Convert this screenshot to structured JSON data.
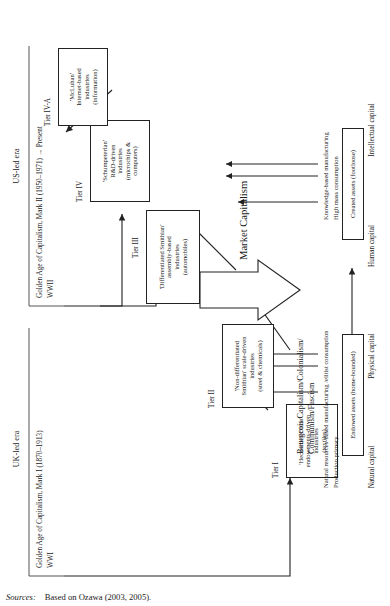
{
  "figure": {
    "orientation": "rotated-90-ccw",
    "sources_label": "Sources:",
    "sources_text": "Based on Ozawa (2003, 2005)."
  },
  "eras": [
    {
      "id": "uk",
      "name": "UK-led era",
      "golden_age": "Golden Age of Capitalism, Mark I (1870–1913)",
      "war": "WWI"
    },
    {
      "id": "us",
      "name": "US-led era",
      "golden_age": "Golden Age of Capitalism, Mark II (1950–1971) → Present",
      "war": "WWII"
    }
  ],
  "tiers": [
    {
      "id": "tier1",
      "label": "Tier I",
      "lines": [
        "'Heckscher-Ohlin'",
        "endowments-driven",
        "industries",
        "(textiles)"
      ]
    },
    {
      "id": "tier2",
      "label": "Tier II",
      "lines": [
        "'Non-differentiated",
        "Smithian' scale-driven",
        "industries",
        "(steel & chemicals)"
      ]
    },
    {
      "id": "tier3",
      "label": "Tier III",
      "lines": [
        "'Differentiated Smithian'",
        "assembly-based",
        "industries",
        "(automobiles)"
      ]
    },
    {
      "id": "tier4",
      "label": "Tier IV",
      "lines": [
        "'Schumpeterian'",
        "R&D-driven",
        "industries",
        "(microchips &",
        "computers)"
      ]
    },
    {
      "id": "tier4a",
      "label": "Tier IV-A",
      "lines": [
        "'McLuhan'",
        "Internet-based",
        "industries",
        "(information)"
      ]
    }
  ],
  "regimes": {
    "bourgeois_line1": "Bourgeois Capitalism/Colonialism/",
    "bourgeois_line2": "Communism/Fascism",
    "market": "Market Capitalism"
  },
  "modes": {
    "early_line1": "Natural resources-based manufacturing /elitist consumption",
    "early_line2": "Production primary",
    "late_line1": "Knowledge-based manufacturing",
    "late_line2": "High mass consumption"
  },
  "assets": [
    {
      "id": "endowed",
      "label": "Endowed assets (home-bounded)"
    },
    {
      "id": "created",
      "label": "Created assets (footloose)"
    }
  ],
  "capitals": [
    {
      "id": "natural",
      "label": "Natural capital"
    },
    {
      "id": "physical",
      "label": "Physical capital"
    },
    {
      "id": "human",
      "label": "Human capital"
    },
    {
      "id": "intellectual",
      "label": "Intellectual capital"
    }
  ],
  "colors": {
    "ink": "#1a1a1a",
    "rule": "#222222",
    "paper": "#ffffff"
  }
}
